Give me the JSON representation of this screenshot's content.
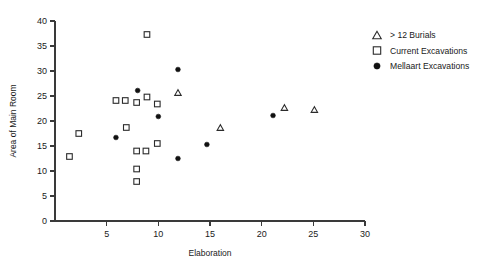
{
  "chart_data": {
    "type": "scatter",
    "title": "",
    "xlabel": "Elaboration",
    "ylabel": "Area of Main Room",
    "xlim": [
      0,
      30
    ],
    "ylim": [
      0,
      40
    ],
    "xticks": [
      0,
      5,
      10,
      15,
      20,
      25,
      30
    ],
    "xtick_labels": [
      "0",
      "5",
      "10",
      "15",
      "20",
      "25",
      "30"
    ],
    "yticks": [
      0,
      5,
      10,
      15,
      20,
      25,
      30,
      35,
      40
    ],
    "ytick_labels": [
      "0",
      "5",
      "10",
      "15",
      "20",
      "25",
      "30",
      "35",
      "40"
    ],
    "grid": false,
    "legend_position": "right",
    "series": [
      {
        "name": "> 12 Burials",
        "marker": "triangle-open",
        "color": "#2b2b2b",
        "points": [
          {
            "x": 11.9,
            "y": 25.7
          },
          {
            "x": 16.0,
            "y": 18.7
          },
          {
            "x": 22.2,
            "y": 22.7
          },
          {
            "x": 25.1,
            "y": 22.3
          }
        ]
      },
      {
        "name": "Current Excavations",
        "marker": "square-open",
        "color": "#2b2b2b",
        "points": [
          {
            "x": 1.4,
            "y": 12.9
          },
          {
            "x": 2.3,
            "y": 17.5
          },
          {
            "x": 5.9,
            "y": 24.1
          },
          {
            "x": 6.8,
            "y": 24.1
          },
          {
            "x": 6.9,
            "y": 18.7
          },
          {
            "x": 7.9,
            "y": 23.7
          },
          {
            "x": 7.9,
            "y": 14.0
          },
          {
            "x": 7.9,
            "y": 10.4
          },
          {
            "x": 7.9,
            "y": 7.9
          },
          {
            "x": 8.8,
            "y": 14.0
          },
          {
            "x": 8.9,
            "y": 24.8
          },
          {
            "x": 8.9,
            "y": 37.3
          },
          {
            "x": 9.9,
            "y": 23.4
          },
          {
            "x": 9.9,
            "y": 15.5
          }
        ]
      },
      {
        "name": "Mellaart Excavations",
        "marker": "circle-filled",
        "color": "#111111",
        "points": [
          {
            "x": 5.9,
            "y": 16.7
          },
          {
            "x": 8.0,
            "y": 26.1
          },
          {
            "x": 10.0,
            "y": 20.9
          },
          {
            "x": 11.9,
            "y": 30.3
          },
          {
            "x": 11.9,
            "y": 12.5
          },
          {
            "x": 14.7,
            "y": 15.3
          },
          {
            "x": 21.1,
            "y": 21.1
          }
        ]
      }
    ]
  },
  "legend": {
    "entries": [
      {
        "label": "> 12 Burials",
        "marker": "triangle-open"
      },
      {
        "label": "Current Excavations",
        "marker": "square-open"
      },
      {
        "label": "Mellaart Excavations",
        "marker": "circle-filled"
      }
    ]
  }
}
